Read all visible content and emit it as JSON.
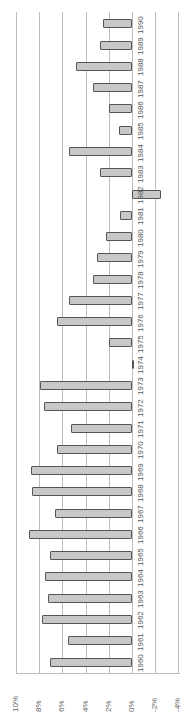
{
  "chart_data": {
    "type": "bar",
    "orientation": "rotated-90-ccw",
    "title": "",
    "xlabel": "",
    "ylabel": "",
    "categories": [
      "1960",
      "1961",
      "1962",
      "1963",
      "1964",
      "1965",
      "1966",
      "1967",
      "1968",
      "1969",
      "1970",
      "1971",
      "1972",
      "1973",
      "1974",
      "1975",
      "1976",
      "1977",
      "1978",
      "1979",
      "1980",
      "1981",
      "1982",
      "1983",
      "1984",
      "1985",
      "1986",
      "1987",
      "1988",
      "1989",
      "1990"
    ],
    "values": [
      7.1,
      5.5,
      7.8,
      7.2,
      7.5,
      7.1,
      8.9,
      6.6,
      8.6,
      8.7,
      6.5,
      5.3,
      7.6,
      7.9,
      -0.1,
      2.0,
      6.5,
      5.4,
      3.4,
      3.0,
      2.2,
      1.0,
      -2.5,
      2.8,
      5.4,
      1.1,
      2.0,
      3.4,
      4.8,
      2.8,
      2.5
    ],
    "value_ticks": [
      "10%",
      "8%",
      "6%",
      "4%",
      "2%",
      "0%",
      "-2%",
      "-4%"
    ],
    "ylim": [
      -4,
      10
    ],
    "grid": true,
    "legend": "none",
    "colors": {
      "bar_fill": "#c8c8c8",
      "bar_border": "#555555",
      "grid": "#bdbdbd"
    }
  }
}
